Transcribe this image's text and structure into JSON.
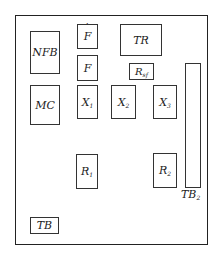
{
  "diagram": {
    "title": "",
    "components": {
      "nfb": {
        "label": "NFB"
      },
      "mc": {
        "label": "MC"
      },
      "f_dot": {
        "label": "F",
        "accent": "dot-above"
      },
      "f": {
        "label": "F"
      },
      "x1": {
        "label": "X",
        "sub": "1"
      },
      "x2": {
        "label": "X",
        "sub": "2"
      },
      "x3": {
        "label": "X",
        "sub": "3"
      },
      "tr": {
        "label": "TR"
      },
      "rsf": {
        "label": "R",
        "sub": "sf"
      },
      "r1": {
        "label": "R",
        "sub": "1"
      },
      "r2": {
        "label": "R",
        "sub": "2"
      },
      "tb": {
        "label": "TB"
      },
      "tb2": {
        "label": "TB",
        "sub": "2"
      }
    }
  }
}
